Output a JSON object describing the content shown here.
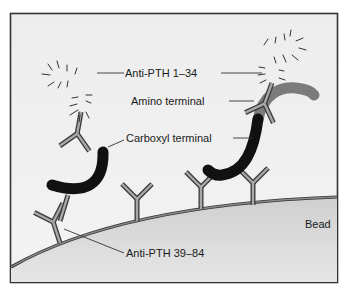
{
  "diagram": {
    "labels": {
      "anti_pth_1_34": "Anti-PTH 1–34",
      "amino_terminal": "Amino terminal",
      "carboxyl_terminal": "Carboxyl terminal",
      "bead": "Bead",
      "anti_pth_39_84": "Anti-PTH 39–84"
    },
    "colors": {
      "background": "#ececec",
      "frame": "#333333",
      "bead": "#d6d6d6",
      "bead_edge": "#7a7a7a",
      "antibody_fill": "#9a9a9a",
      "antibody_edge": "#3a3a3a",
      "amino_segment": "#7b7b7b",
      "carboxyl_segment": "#111111"
    }
  }
}
